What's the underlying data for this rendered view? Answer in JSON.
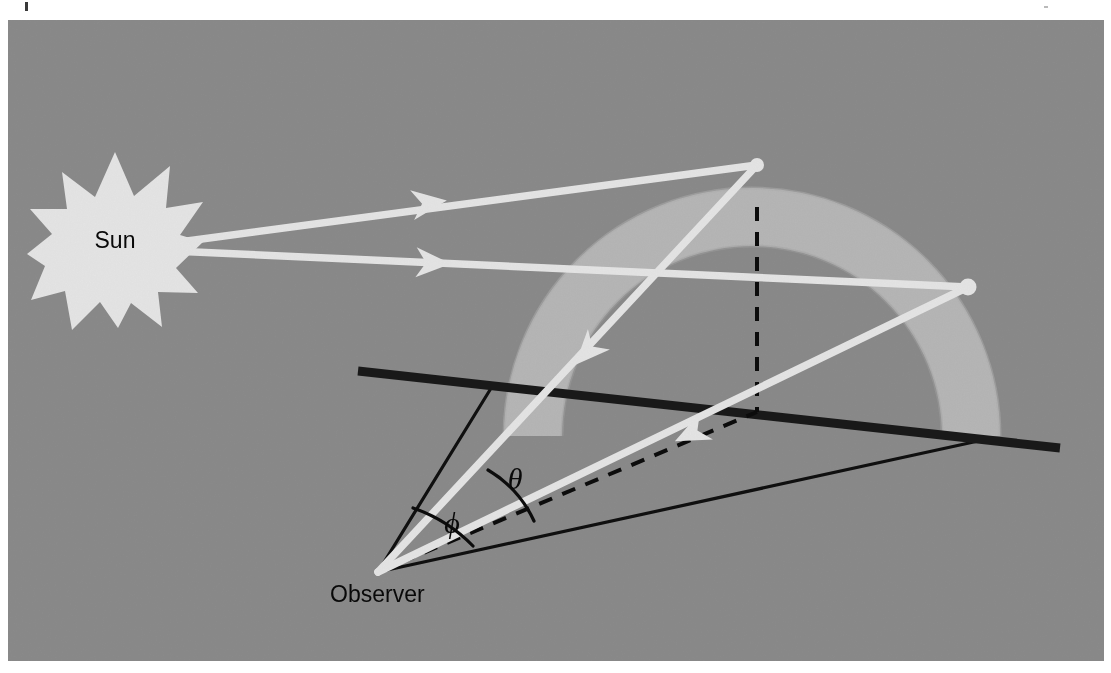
{
  "figure": {
    "panel": {
      "background_color": "#9a9a9a",
      "x": 8,
      "y": 20,
      "width": 1096,
      "height": 641
    },
    "page_background_color": "#ffffff"
  },
  "labels": {
    "sun": "Sun",
    "observer": "Observer",
    "theta": "θ",
    "phi": "ϕ"
  },
  "colors": {
    "background_gray": "#9a9a9a",
    "ray_white": "#ffffff",
    "rainbow_band": "#cfcfcf",
    "line_black": "#111111",
    "horizon_black": "#1a1a1a",
    "text_black": "#0a0a0a"
  },
  "elements": {
    "sun": {
      "name": "Sun",
      "center_x": 115,
      "center_y": 240,
      "outer_radius": 88,
      "inner_radius": 52,
      "points": 12,
      "fill": "#ffffff"
    },
    "observer": {
      "name": "Observer",
      "x": 378,
      "y": 572,
      "label_x": 330,
      "label_y": 600
    },
    "rainbow_arc": {
      "name": "Rainbow band",
      "center_x": 752,
      "center_y": 436,
      "inner_radius": 190,
      "outer_radius": 248,
      "fill": "#cfcfcf",
      "description": "Light gray semicircular band representing the rainbow"
    },
    "horizon_line": {
      "name": "Horizon",
      "x1": 358,
      "y1": 371,
      "x2": 1060,
      "y2": 448,
      "stroke_width": 9
    },
    "zenith_dashed_line": {
      "name": "Vertical dashed line from arc top to ground",
      "x1": 757,
      "y1": 207,
      "x2": 757,
      "y2": 412
    },
    "antisolar_dashed_line": {
      "name": "Dashed antisolar axis from observer to ground point",
      "x1": 378,
      "y1": 572,
      "x2": 757,
      "y2": 412
    },
    "rays": [
      {
        "name": "Upper sun ray to upper raindrop",
        "from": "Sun",
        "to": "upper raindrop",
        "x1": 178,
        "y1": 244,
        "x2": 757,
        "y2": 165,
        "arrow_at": 0.42
      },
      {
        "name": "Lower sun ray to lower raindrop",
        "from": "Sun",
        "to": "lower raindrop",
        "x1": 178,
        "y1": 250,
        "x2": 968,
        "y2": 287,
        "arrow_at": 0.37
      },
      {
        "name": "Reflected ray from upper raindrop to observer",
        "from": "upper raindrop",
        "to": "Observer",
        "x1": 757,
        "y1": 165,
        "x2": 378,
        "y2": 572,
        "arrow_at": 0.52
      },
      {
        "name": "Reflected ray from lower raindrop to observer",
        "from": "lower raindrop",
        "to": "Observer",
        "x1": 968,
        "y1": 287,
        "x2": 378,
        "y2": 572,
        "arrow_at": 0.53
      }
    ],
    "sight_lines": [
      {
        "name": "Upper sight line from observer to horizon",
        "x1": 378,
        "y1": 572,
        "x2": 493,
        "y2": 385
      },
      {
        "name": "Ground sight line from observer to horizon right",
        "x1": 378,
        "y1": 572,
        "x2": 992,
        "y2": 438
      }
    ],
    "angle_arcs": [
      {
        "name": "theta-angle-arc",
        "symbol": "θ",
        "label_x": 515,
        "label_y": 489,
        "description": "Angle between the reflected ray to the upper raindrop and the antisolar axis"
      },
      {
        "name": "phi-angle-arc",
        "symbol": "ϕ",
        "label_x": 452,
        "label_y": 532,
        "description": "Angle between the upper sight line and the antisolar axis"
      }
    ],
    "raindrops": [
      {
        "name": "upper-raindrop",
        "x": 757,
        "y": 165,
        "r": 7
      },
      {
        "name": "lower-raindrop",
        "x": 968,
        "y": 287,
        "r": 8
      }
    ]
  }
}
